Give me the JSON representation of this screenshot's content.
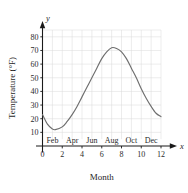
{
  "chart_data": {
    "type": "line",
    "title": "",
    "subtitle": "",
    "xlabel": "Month",
    "ylabel": "Temperature (°F)",
    "x_axis_variable": "x",
    "y_axis_variable": "y",
    "xlim": [
      0,
      12
    ],
    "ylim": [
      0,
      85
    ],
    "grid": true,
    "legend": "none",
    "x_ticks": [
      0,
      2,
      4,
      6,
      8,
      10,
      12
    ],
    "x_tick_labels": [
      "0",
      "2",
      "4",
      "6",
      "8",
      "10",
      "12"
    ],
    "y_ticks": [
      10,
      20,
      30,
      40,
      50,
      60,
      70,
      80
    ],
    "y_tick_labels": [
      "10",
      "20",
      "30",
      "40",
      "50",
      "60",
      "70",
      "80"
    ],
    "month_labels": [
      "Feb",
      "Apr",
      "Jun",
      "Aug",
      "Oct",
      "Dec"
    ],
    "month_label_positions": [
      2,
      4,
      6,
      8,
      10,
      12
    ],
    "series": [
      {
        "name": "Average monthly temperature",
        "color": "#6e6e6e",
        "x": [
          0,
          0.5,
          1,
          1.3,
          2,
          2.5,
          3,
          3.5,
          4,
          4.5,
          5,
          5.5,
          6,
          6.5,
          7,
          7.5,
          8,
          8.5,
          9,
          9.5,
          10,
          10.5,
          11,
          11.5,
          12
        ],
        "values": [
          23,
          16,
          12.5,
          12,
          14,
          18,
          23,
          29,
          36,
          43,
          50,
          57,
          64,
          69,
          72,
          71.5,
          69,
          64,
          57,
          50,
          42,
          35,
          29,
          24,
          21.5
        ]
      }
    ],
    "annotations": {
      "minimum": {
        "x": 1.3,
        "y": 12
      },
      "maximum": {
        "x": 7,
        "y": 72
      },
      "start": {
        "x": 0,
        "y": 23
      },
      "end": {
        "x": 12,
        "y": 21.5
      }
    }
  },
  "axis": {
    "y_title": "Temperature (°F)",
    "x_title": "Month",
    "y_variable": "y",
    "x_variable": "x"
  }
}
